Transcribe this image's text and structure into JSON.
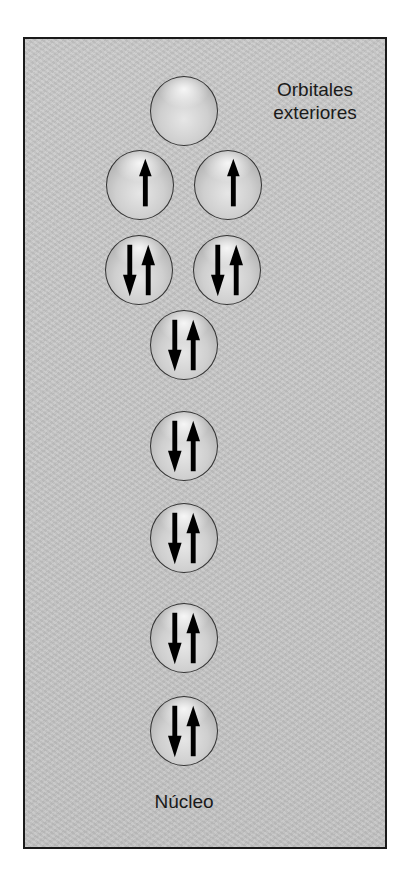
{
  "diagram": {
    "title_label": "Orbitales exteriores",
    "title_lines": [
      "Orbitales",
      "exteriores"
    ],
    "bottom_label": "Núcleo",
    "orbitals": [
      {
        "row": 1,
        "electrons": "empty"
      },
      {
        "row": 2,
        "electrons": "up"
      },
      {
        "row": 2,
        "electrons": "up"
      },
      {
        "row": 3,
        "electrons": "pair"
      },
      {
        "row": 3,
        "electrons": "pair"
      },
      {
        "row": 4,
        "electrons": "pair"
      },
      {
        "row": 5,
        "electrons": "pair"
      },
      {
        "row": 6,
        "electrons": "pair"
      },
      {
        "row": 7,
        "electrons": "pair"
      },
      {
        "row": 8,
        "electrons": "pair"
      }
    ],
    "colors": {
      "background": "#c6c6c6",
      "border": "#1a1a1a",
      "arrow": "#000000"
    }
  }
}
